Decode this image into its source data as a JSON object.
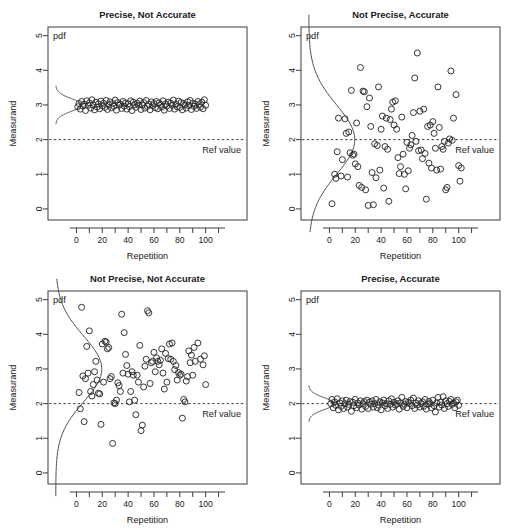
{
  "figure": {
    "name": "precision-accuracy-2x2-panels",
    "background": "#ffffff",
    "foreground": "#1a1a1a",
    "point_stroke": "#2b2b2b",
    "ref_value": 2,
    "ref_label": "Ref value",
    "pdf_label": "pdf",
    "xlabel": "Repetition",
    "ylabel": "Measurand",
    "xlim": [
      -22,
      132
    ],
    "ylim": [
      -0.32,
      5.25
    ],
    "x_major_ticks": [
      0,
      20,
      40,
      60,
      80,
      100
    ],
    "x_major_tick_labels": [
      "0",
      "20",
      "40",
      "60",
      "80",
      "100"
    ],
    "x_minor_ticks": [
      10,
      30,
      50,
      70,
      90,
      110
    ],
    "y_ticks": [
      0,
      1,
      2,
      3,
      4,
      5
    ],
    "y_tick_labels": [
      "0",
      "1",
      "2",
      "3",
      "4",
      "5"
    ],
    "grid": false,
    "legend": "none",
    "marker": "open-circle",
    "marker_radius_px": 3.0
  },
  "chart_data": [
    {
      "type": "scatter",
      "panel": "top-left",
      "title": "Precise, Not Accurate",
      "xlabel": "Repetition",
      "ylabel": "Measurand",
      "xlim": [
        -22,
        132
      ],
      "ylim": [
        -0.32,
        5.25
      ],
      "grid": false,
      "legend": "none",
      "annotations": [
        "pdf",
        "Ref value"
      ],
      "ref_line_y": 2,
      "pdf": {
        "mean": 3.0,
        "sd": 0.18,
        "orientation": "vertical-left-margin"
      },
      "series": [
        {
          "name": "measurements",
          "mean": 3.0,
          "sd": 0.12,
          "x": [
            1,
            2,
            3,
            4,
            5,
            6,
            7,
            8,
            9,
            10,
            11,
            12,
            13,
            14,
            15,
            16,
            17,
            18,
            19,
            20,
            21,
            22,
            23,
            24,
            25,
            26,
            27,
            28,
            29,
            30,
            31,
            32,
            33,
            34,
            35,
            36,
            37,
            38,
            39,
            40,
            41,
            42,
            43,
            44,
            45,
            46,
            47,
            48,
            49,
            50,
            51,
            52,
            53,
            54,
            55,
            56,
            57,
            58,
            59,
            60,
            61,
            62,
            63,
            64,
            65,
            66,
            67,
            68,
            69,
            70,
            71,
            72,
            73,
            74,
            75,
            76,
            77,
            78,
            79,
            80,
            81,
            82,
            83,
            84,
            85,
            86,
            87,
            88,
            89,
            90,
            91,
            92,
            93,
            94,
            95,
            96,
            97,
            98,
            99,
            100
          ],
          "values": [
            2.95,
            3.04,
            2.88,
            3.1,
            2.97,
            3.02,
            2.84,
            3.12,
            2.99,
            3.06,
            2.91,
            3.15,
            3.0,
            2.86,
            3.08,
            2.94,
            3.03,
            2.89,
            3.11,
            2.98,
            3.05,
            2.93,
            3.13,
            2.87,
            3.01,
            3.09,
            2.92,
            3.04,
            2.96,
            3.14,
            2.85,
            3.07,
            2.99,
            3.02,
            2.9,
            3.1,
            2.97,
            3.06,
            2.88,
            3.03,
            2.95,
            3.12,
            2.84,
            3.08,
            3.01,
            2.93,
            3.05,
            2.99,
            3.11,
            2.87,
            3.0,
            3.07,
            2.91,
            3.13,
            2.96,
            3.02,
            2.86,
            3.09,
            2.98,
            3.04,
            2.92,
            3.1,
            2.89,
            3.06,
            3.01,
            2.94,
            3.12,
            2.85,
            3.03,
            2.97,
            3.08,
            2.9,
            3.05,
            2.99,
            3.14,
            2.88,
            3.02,
            2.95,
            3.11,
            2.93,
            3.07,
            2.86,
            3.04,
            3.0,
            2.91,
            3.09,
            2.98,
            3.13,
            2.87,
            3.05,
            2.96,
            3.02,
            2.9,
            3.1,
            3.01,
            2.94,
            3.08,
            2.89,
            3.15,
            2.99
          ]
        }
      ]
    },
    {
      "type": "scatter",
      "panel": "top-right",
      "title": "Not Precise, Accurate",
      "xlabel": "Repetition",
      "ylabel": "Measurand",
      "xlim": [
        -22,
        132
      ],
      "ylim": [
        -0.32,
        5.25
      ],
      "grid": false,
      "legend": "none",
      "annotations": [
        "pdf",
        "Ref value"
      ],
      "ref_line_y": 2,
      "pdf": {
        "mean": 2.0,
        "sd": 1.0,
        "orientation": "vertical-left-margin"
      },
      "series": [
        {
          "name": "measurements",
          "mean": 2.0,
          "sd": 1.0,
          "x": [
            2,
            4,
            5,
            6,
            7,
            9,
            10,
            12,
            13,
            14,
            15,
            16,
            17,
            18,
            19,
            20,
            21,
            22,
            23,
            24,
            25,
            26,
            27,
            28,
            29,
            30,
            31,
            32,
            33,
            34,
            35,
            36,
            37,
            38,
            39,
            40,
            41,
            42,
            43,
            44,
            45,
            46,
            47,
            48,
            49,
            50,
            51,
            52,
            53,
            54,
            55,
            56,
            57,
            58,
            59,
            60,
            61,
            62,
            63,
            64,
            65,
            66,
            67,
            68,
            69,
            70,
            71,
            72,
            73,
            74,
            75,
            76,
            77,
            78,
            79,
            80,
            81,
            82,
            83,
            84,
            85,
            86,
            87,
            88,
            89,
            90,
            91,
            92,
            93,
            94,
            95,
            96,
            98,
            100,
            101,
            102
          ],
          "values": [
            0.15,
            1.0,
            0.88,
            1.65,
            2.62,
            0.95,
            1.42,
            2.6,
            2.18,
            0.92,
            2.22,
            1.62,
            3.42,
            1.55,
            1.58,
            1.3,
            2.48,
            1.22,
            0.68,
            4.08,
            0.62,
            3.4,
            3.38,
            0.55,
            2.95,
            0.1,
            3.2,
            2.38,
            1.05,
            0.12,
            1.88,
            0.9,
            1.83,
            3.52,
            1.12,
            2.3,
            2.68,
            0.6,
            1.8,
            2.62,
            1.72,
            0.22,
            2.58,
            2.88,
            3.08,
            2.42,
            3.12,
            2.3,
            1.48,
            1.02,
            1.22,
            2.65,
            1.58,
            1.0,
            0.58,
            1.92,
            1.1,
            1.75,
            1.85,
            2.12,
            2.78,
            3.78,
            1.95,
            4.5,
            1.68,
            2.82,
            1.7,
            1.45,
            2.88,
            1.6,
            0.28,
            2.38,
            1.32,
            2.42,
            1.18,
            2.52,
            2.18,
            1.75,
            1.12,
            3.52,
            2.35,
            1.15,
            1.8,
            1.72,
            1.95,
            0.55,
            0.62,
            1.9,
            2.02,
            3.98,
            1.98,
            2.62,
            3.3,
            1.25,
            0.8,
            1.18
          ]
        }
      ]
    },
    {
      "type": "scatter",
      "panel": "bottom-left",
      "title": "Not Precise, Not Accurate",
      "xlabel": "Repetition",
      "ylabel": "Measurand",
      "xlim": [
        -22,
        132
      ],
      "ylim": [
        -0.32,
        5.25
      ],
      "grid": false,
      "legend": "none",
      "annotations": [
        "pdf",
        "Ref value"
      ],
      "ref_line_y": 2,
      "pdf": {
        "mean": 3.0,
        "sd": 0.95,
        "orientation": "vertical-left-margin"
      },
      "series": [
        {
          "name": "measurements",
          "mean": 3.0,
          "sd": 0.7,
          "x": [
            2,
            3,
            4,
            5,
            6,
            7,
            8,
            9,
            10,
            11,
            12,
            13,
            14,
            15,
            16,
            17,
            18,
            19,
            20,
            21,
            22,
            23,
            24,
            25,
            26,
            27,
            28,
            29,
            30,
            31,
            32,
            33,
            34,
            35,
            36,
            37,
            38,
            39,
            40,
            41,
            42,
            43,
            44,
            45,
            46,
            47,
            48,
            49,
            50,
            51,
            52,
            53,
            54,
            55,
            56,
            57,
            58,
            59,
            60,
            61,
            62,
            63,
            64,
            65,
            66,
            67,
            68,
            69,
            70,
            71,
            72,
            73,
            74,
            75,
            76,
            77,
            78,
            79,
            80,
            81,
            82,
            83,
            84,
            85,
            86,
            87,
            88,
            89,
            90,
            91,
            92,
            94,
            96,
            98,
            99,
            100
          ],
          "values": [
            2.32,
            1.85,
            4.78,
            2.8,
            1.48,
            2.72,
            3.65,
            2.88,
            4.1,
            2.35,
            2.22,
            2.55,
            2.92,
            3.22,
            2.68,
            2.3,
            2.28,
            1.4,
            3.72,
            2.62,
            3.8,
            3.78,
            3.58,
            3.62,
            2.72,
            2.78,
            0.85,
            2.02,
            2.0,
            2.1,
            2.6,
            2.52,
            2.35,
            4.58,
            2.88,
            4.05,
            3.42,
            3.1,
            2.85,
            2.05,
            2.35,
            2.92,
            2.82,
            2.1,
            1.68,
            2.82,
            2.62,
            3.68,
            1.22,
            1.38,
            2.48,
            3.08,
            3.28,
            4.68,
            4.62,
            2.58,
            3.18,
            3.22,
            3.48,
            2.92,
            3.32,
            3.22,
            3.12,
            3.25,
            3.58,
            2.88,
            2.42,
            3.45,
            2.62,
            3.3,
            3.72,
            3.28,
            3.75,
            3.22,
            2.98,
            3.1,
            2.68,
            2.9,
            2.82,
            2.85,
            1.58,
            2.12,
            2.05,
            2.65,
            2.78,
            3.52,
            3.18,
            3.4,
            2.82,
            3.62,
            3.22,
            3.75,
            3.28,
            3.12,
            3.38,
            2.55
          ]
        }
      ]
    },
    {
      "type": "scatter",
      "panel": "bottom-right",
      "title": "Precise, Accurate",
      "xlabel": "Repetition",
      "ylabel": "Measurand",
      "xlim": [
        -22,
        132
      ],
      "ylim": [
        -0.32,
        5.25
      ],
      "grid": false,
      "legend": "none",
      "annotations": [
        "pdf",
        "Ref value"
      ],
      "ref_line_y": 2,
      "pdf": {
        "mean": 2.0,
        "sd": 0.17,
        "orientation": "vertical-left-margin"
      },
      "series": [
        {
          "name": "measurements",
          "mean": 2.0,
          "sd": 0.12,
          "x": [
            1,
            2,
            3,
            4,
            5,
            6,
            7,
            8,
            9,
            10,
            11,
            12,
            13,
            14,
            15,
            16,
            17,
            18,
            19,
            20,
            21,
            22,
            23,
            24,
            25,
            26,
            27,
            28,
            29,
            30,
            31,
            32,
            33,
            34,
            35,
            36,
            37,
            38,
            39,
            40,
            41,
            42,
            43,
            44,
            45,
            46,
            47,
            48,
            49,
            50,
            51,
            52,
            53,
            54,
            55,
            56,
            57,
            58,
            59,
            60,
            61,
            62,
            63,
            64,
            65,
            66,
            67,
            68,
            69,
            70,
            71,
            72,
            73,
            74,
            75,
            76,
            77,
            78,
            79,
            80,
            81,
            82,
            83,
            84,
            85,
            86,
            87,
            88,
            89,
            90,
            91,
            92,
            93,
            94,
            95,
            96,
            97,
            98,
            99,
            100
          ],
          "values": [
            2.0,
            2.12,
            1.88,
            2.05,
            1.95,
            2.14,
            1.82,
            2.02,
            1.92,
            2.08,
            1.86,
            2.0,
            2.1,
            1.9,
            1.98,
            2.06,
            1.78,
            2.04,
            1.94,
            2.12,
            1.88,
            2.02,
            1.96,
            2.08,
            1.84,
            2.0,
            2.06,
            1.92,
            2.1,
            1.86,
            2.04,
            1.98,
            2.08,
            1.9,
            2.0,
            2.12,
            1.88,
            1.96,
            2.05,
            1.82,
            2.02,
            2.1,
            1.94,
            2.0,
            1.86,
            2.08,
            1.98,
            2.14,
            1.9,
            2.04,
            1.96,
            2.0,
            2.08,
            1.84,
            2.02,
            2.18,
            1.92,
            1.98,
            2.06,
            1.88,
            2.04,
            2.0,
            2.1,
            1.94,
            2.16,
            1.86,
            2.02,
            1.96,
            2.08,
            1.9,
            2.0,
            2.05,
            1.92,
            2.12,
            1.84,
            1.98,
            2.06,
            2.0,
            1.88,
            2.1,
            1.94,
            1.76,
            2.02,
            2.18,
            1.9,
            2.04,
            1.96,
            2.2,
            1.86,
            2.08,
            2.0,
            1.92,
            2.06,
            2.12,
            1.98,
            2.02,
            1.88,
            2.05,
            2.1,
            1.95
          ]
        }
      ]
    }
  ]
}
